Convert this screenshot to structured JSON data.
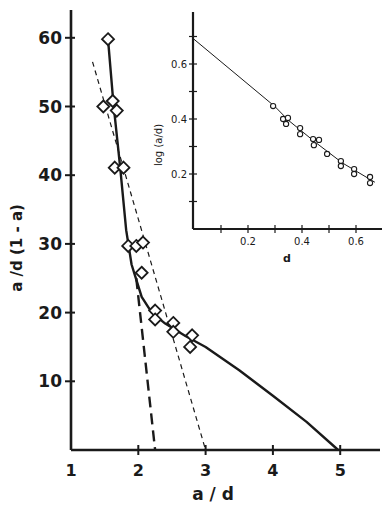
{
  "chart_data": [
    {
      "id": "main",
      "type": "scatter",
      "title": "",
      "xlabel": "a / d",
      "ylabel": "a / d (1 - a)",
      "xlim": [
        1,
        5.6
      ],
      "ylim": [
        0,
        64
      ],
      "xticks": [
        1,
        2,
        3,
        4,
        5
      ],
      "xtick_labels": [
        "1",
        "2",
        "3",
        "4",
        "5"
      ],
      "yticks": [
        10,
        20,
        30,
        40,
        50,
        60
      ],
      "ytick_labels": [
        "10",
        "20",
        "30",
        "40",
        "50",
        "60"
      ],
      "grid": false,
      "legend": null,
      "marker": "diamond",
      "series": [
        {
          "name": "data points",
          "style": "diamond-open",
          "x": [
            1.55,
            1.48,
            1.62,
            1.68,
            1.65,
            1.78,
            1.85,
            1.97,
            2.07,
            2.05,
            2.25,
            2.25,
            2.52,
            2.52,
            2.8,
            2.77
          ],
          "y": [
            59.8,
            50.0,
            50.8,
            49.4,
            41.1,
            41.1,
            29.7,
            29.7,
            30.2,
            25.8,
            20.3,
            19.0,
            18.5,
            17.2,
            16.7,
            15.0
          ]
        },
        {
          "name": "solid fit curve",
          "style": "solid",
          "x": [
            1.55,
            1.63,
            1.73,
            1.82,
            1.9,
            1.97,
            2.05,
            2.2,
            2.4,
            2.7,
            3.0,
            3.5,
            4.0,
            4.5,
            4.97
          ],
          "y": [
            59.8,
            50.5,
            41.2,
            32.0,
            27.0,
            24.8,
            22.3,
            20.0,
            18.4,
            16.6,
            15.0,
            11.6,
            7.9,
            4.1,
            0
          ]
        },
        {
          "name": "long-dash extrapolation",
          "style": "dashed",
          "x": [
            1.97,
            2.25
          ],
          "y": [
            25.0,
            0
          ]
        },
        {
          "name": "short-dash line",
          "style": "dotted",
          "x": [
            1.32,
            3.0
          ],
          "y": [
            56.5,
            0
          ]
        }
      ]
    },
    {
      "id": "inset",
      "type": "scatter",
      "title": "",
      "xlabel": "d",
      "ylabel": "log (a/d)",
      "xlim": [
        0,
        0.7
      ],
      "ylim": [
        0,
        0.75
      ],
      "xticks": [
        0.1,
        0.2,
        0.3,
        0.4,
        0.5,
        0.6
      ],
      "xtick_labels": [
        "",
        "0.2",
        "",
        "0.4",
        "",
        "0.6"
      ],
      "yticks": [
        0.1,
        0.2,
        0.3,
        0.4,
        0.5,
        0.6,
        0.7
      ],
      "ytick_labels": [
        "",
        "0.2",
        "",
        "0.4",
        "",
        "0.6",
        ""
      ],
      "grid": false,
      "legend": null,
      "series": [
        {
          "name": "data points",
          "style": "circle-open",
          "x": [
            0.293,
            0.33,
            0.348,
            0.341,
            0.393,
            0.393,
            0.441,
            0.463,
            0.444,
            0.493,
            0.544,
            0.544,
            0.593,
            0.593,
            0.652,
            0.652
          ],
          "y": [
            0.447,
            0.4,
            0.404,
            0.382,
            0.367,
            0.345,
            0.327,
            0.324,
            0.305,
            0.273,
            0.247,
            0.229,
            0.218,
            0.2,
            0.189,
            0.167
          ]
        },
        {
          "name": "fit line",
          "style": "solid",
          "x": [
            0,
            0.3,
            0.35,
            0.45,
            0.55,
            0.67
          ],
          "y": [
            0.69,
            0.445,
            0.395,
            0.315,
            0.24,
            0.17
          ]
        }
      ]
    }
  ],
  "labels": {
    "main_xlabel": "a / d",
    "main_ylabel": "a /d (1 - a)",
    "inset_xlabel": "d",
    "inset_ylabel": "log (a/d)"
  },
  "colors": {
    "ink": "#1a1a1a",
    "background": "#ffffff"
  }
}
